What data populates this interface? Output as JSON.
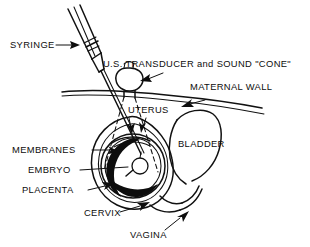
{
  "figure": {
    "ink_color": "#111111",
    "background_color": "#ffffff",
    "placenta_fill": "#0d0d0d"
  },
  "labels": {
    "syringe": "SYRINGE",
    "transducer": "U.S. TRANSDUCER and SOUND \"CONE\"",
    "maternal_wall": "MATERNAL WALL",
    "uterus": "UTERUS",
    "membranes": "MEMBRANES",
    "embryo": "EMBRYO",
    "placenta": "PLACENTA",
    "bladder": "BLADDER",
    "cervix": "CERVIX",
    "vagina": "VAGINA"
  }
}
